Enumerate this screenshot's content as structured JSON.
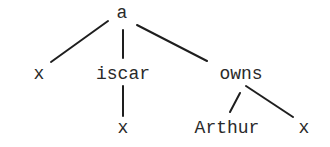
{
  "tree": {
    "root": {
      "label": "a",
      "children": [
        {
          "label": "x",
          "children": []
        },
        {
          "label": "iscar",
          "children": [
            {
              "label": "x",
              "children": []
            }
          ]
        },
        {
          "label": "owns",
          "children": [
            {
              "label": "Arthur",
              "children": []
            },
            {
              "label": "x",
              "children": []
            }
          ]
        }
      ]
    }
  },
  "nodes": {
    "root": "a",
    "child_x": "x",
    "child_iscar": "iscar",
    "child_owns": "owns",
    "iscar_x": "x",
    "owns_arthur": "Arthur",
    "owns_x": "x"
  },
  "colors": {
    "ink": "#1e1e1e",
    "background": "#ffffff"
  }
}
